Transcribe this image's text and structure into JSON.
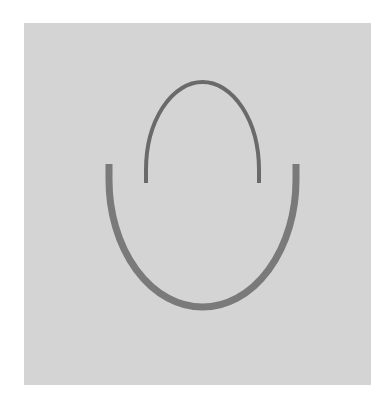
{
  "figure": {
    "background_color": "#ffffff",
    "panel_color": "#d4d4d4",
    "shapes": [
      {
        "name": "inner-arc",
        "type": "half-ellipse-open-bottom",
        "center_x": 202,
        "end_y": 183,
        "top_y": 82,
        "left_x": 146,
        "right_x": 259,
        "stroke_width": 4,
        "color": "#6a6a6a"
      },
      {
        "name": "outer-u",
        "type": "half-ellipse-open-top",
        "center_x": 202,
        "end_y": 164,
        "bottom_y": 307,
        "left_x": 109,
        "right_x": 296,
        "stroke_width": 7,
        "color": "#7a7a7a"
      }
    ]
  }
}
